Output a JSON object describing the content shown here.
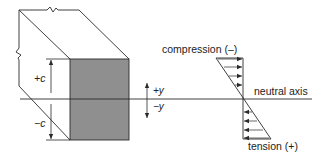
{
  "figure": {
    "labels": {
      "plus_c": "+c",
      "minus_c": "−c",
      "plus_y": "+y",
      "minus_y": "−y",
      "compression": "compression (–)",
      "neutral_axis": "neutral axis",
      "tension": "tension (+)"
    },
    "colors": {
      "line": "#2a2a2a",
      "section_fill": "#8f8f8f",
      "background": "#ffffff"
    },
    "icons": {
      "break_mark": "zigzag-break",
      "arrow": "arrowhead"
    }
  }
}
